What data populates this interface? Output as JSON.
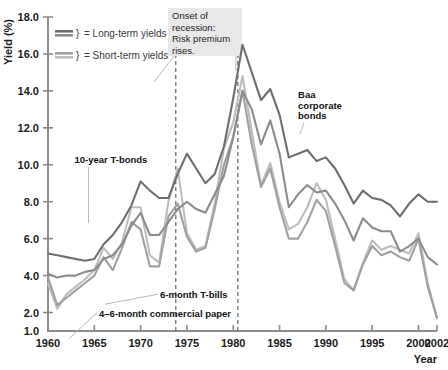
{
  "chart_data": {
    "type": "line",
    "title": "",
    "xlabel": "Year",
    "ylabel": "Yield (%)",
    "xlim": [
      1960,
      2002
    ],
    "ylim": [
      1.0,
      18.0
    ],
    "grid": false,
    "legend_position": "top-left",
    "x_ticks": [
      1960,
      1965,
      1970,
      1975,
      1980,
      1985,
      1990,
      1995,
      2000,
      2002
    ],
    "x_tick_labels": [
      "1960",
      "1965",
      "1970",
      "1975",
      "1980",
      "1985",
      "1990",
      "1995",
      "2000",
      "2002"
    ],
    "y_ticks": [
      1.0,
      2.0,
      4.0,
      6.0,
      8.0,
      10.0,
      12.0,
      14.0,
      16.0,
      18.0
    ],
    "y_tick_labels": [
      "1.0",
      "2.0",
      "4.0",
      "6.0",
      "8.0",
      "10.0",
      "12.0",
      "14.0",
      "16.0",
      "18.0"
    ],
    "x": [
      1960,
      1961,
      1962,
      1963,
      1964,
      1965,
      1966,
      1967,
      1968,
      1969,
      1970,
      1971,
      1972,
      1973,
      1974,
      1975,
      1976,
      1977,
      1978,
      1979,
      1980,
      1981,
      1982,
      1983,
      1984,
      1985,
      1986,
      1987,
      1988,
      1989,
      1990,
      1991,
      1992,
      1993,
      1994,
      1995,
      1996,
      1997,
      1998,
      1999,
      2000,
      2001,
      2002
    ],
    "series": [
      {
        "name": "Baa corporate bonds",
        "color": "#6d6e71",
        "category": "long-term",
        "values": [
          5.2,
          5.1,
          5.0,
          4.9,
          4.8,
          4.9,
          5.7,
          6.2,
          6.9,
          7.8,
          9.1,
          8.6,
          8.2,
          8.2,
          9.5,
          10.6,
          9.8,
          9.0,
          9.5,
          11.0,
          13.6,
          16.5,
          15.0,
          13.5,
          14.1,
          12.7,
          10.4,
          10.6,
          10.8,
          10.2,
          10.4,
          9.8,
          8.9,
          7.9,
          8.6,
          8.2,
          8.1,
          7.8,
          7.2,
          7.9,
          8.4,
          8.0,
          8.0
        ]
      },
      {
        "name": "10-year T-bonds",
        "color": "#8b8c8f",
        "category": "long-term",
        "values": [
          4.1,
          3.9,
          4.0,
          4.0,
          4.2,
          4.3,
          4.9,
          5.1,
          5.7,
          6.7,
          7.4,
          6.2,
          6.2,
          6.9,
          7.6,
          8.0,
          7.6,
          7.4,
          8.4,
          9.4,
          11.5,
          14.0,
          13.0,
          11.1,
          12.4,
          10.6,
          7.7,
          8.4,
          8.9,
          8.5,
          8.6,
          7.9,
          7.0,
          5.9,
          7.1,
          6.6,
          6.4,
          6.4,
          5.3,
          5.6,
          6.0,
          5.0,
          4.6
        ]
      },
      {
        "name": "6-month T-bills",
        "color": "#9fa0a3",
        "category": "short-term",
        "values": [
          3.9,
          2.4,
          2.8,
          3.2,
          3.6,
          4.0,
          5.0,
          4.3,
          5.5,
          6.9,
          6.5,
          4.5,
          4.5,
          7.2,
          7.9,
          6.1,
          5.3,
          5.5,
          7.6,
          10.0,
          11.5,
          14.0,
          11.1,
          8.8,
          9.8,
          7.7,
          6.0,
          6.0,
          6.9,
          8.1,
          7.5,
          5.6,
          3.6,
          3.2,
          4.6,
          5.6,
          5.1,
          5.3,
          5.0,
          4.8,
          6.0,
          3.4,
          1.7
        ]
      },
      {
        "name": "4-6-month commercial paper",
        "color": "#bcbdbf",
        "category": "short-term",
        "values": [
          3.6,
          2.2,
          3.0,
          3.4,
          3.8,
          4.3,
          5.5,
          4.9,
          5.8,
          7.7,
          7.7,
          5.1,
          4.7,
          8.0,
          9.8,
          6.3,
          5.4,
          5.6,
          7.9,
          10.9,
          12.3,
          14.8,
          11.8,
          8.9,
          10.1,
          8.0,
          6.5,
          6.8,
          7.7,
          9.0,
          8.1,
          6.0,
          3.8,
          3.2,
          4.7,
          5.9,
          5.4,
          5.6,
          5.4,
          5.2,
          6.3,
          3.6,
          1.7
        ]
      }
    ],
    "annotations": [
      {
        "name": "baa-label",
        "text": "Baa\ncorporate\nbonds",
        "x": 1987,
        "y": 13.6
      },
      {
        "name": "tbond-label",
        "text": "10-year T-bonds",
        "x": 1962,
        "y": 10.1
      },
      {
        "name": "tbill-label",
        "text": "6-month T-bills",
        "x": 1968,
        "y": 3.1
      },
      {
        "name": "commpaper-label",
        "text": "4–6-month commercial paper",
        "x": 1964,
        "y": 2.1
      }
    ],
    "callout": {
      "name": "recession-callout",
      "lines": [
        "Onset of",
        "recession:",
        "Risk premium",
        "rises."
      ]
    },
    "vertical_markers": [
      {
        "name": "recession-marker-1974",
        "year": 1973.8
      },
      {
        "name": "recession-marker-1981",
        "year": 1980.5
      }
    ],
    "legend": [
      {
        "label": "= Long-term yields",
        "colors": [
          "#6d6e71",
          "#8b8c8f"
        ]
      },
      {
        "label": "= Short-term yields",
        "colors": [
          "#9fa0a3",
          "#bcbdbf"
        ]
      }
    ]
  }
}
